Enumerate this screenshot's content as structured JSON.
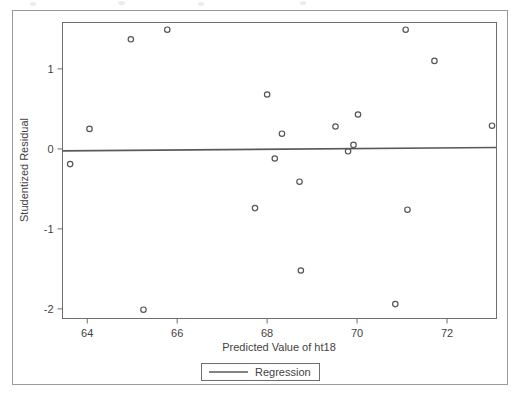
{
  "chart_data": {
    "type": "scatter",
    "title": "",
    "xlabel": "Predicted Value of ht18",
    "ylabel": "Studentized Residual",
    "xlim": [
      63.45,
      73.1
    ],
    "ylim": [
      -2.12,
      1.58
    ],
    "xticks": [
      64,
      66,
      68,
      70,
      72
    ],
    "yticks": [
      1,
      0,
      -1,
      -2
    ],
    "xtick_labels": [
      "64",
      "66",
      "68",
      "70",
      "72"
    ],
    "ytick_labels": [
      "1",
      "0",
      "-1",
      "-2"
    ],
    "grid": false,
    "marker": "open-circle",
    "marker_color": "#555555",
    "legend": {
      "position": "below-axis-centered",
      "entries": [
        {
          "label": "Regression",
          "type": "line",
          "color": "#5a5a5a"
        }
      ]
    },
    "series": [
      {
        "name": "Studentized Residual",
        "type": "scatter",
        "points": [
          {
            "x": 63.62,
            "y": -0.19
          },
          {
            "x": 64.05,
            "y": 0.25
          },
          {
            "x": 64.97,
            "y": 1.37
          },
          {
            "x": 65.25,
            "y": -2.01
          },
          {
            "x": 65.78,
            "y": 1.49
          },
          {
            "x": 67.73,
            "y": -0.74
          },
          {
            "x": 68.0,
            "y": 0.68
          },
          {
            "x": 68.17,
            "y": -0.12
          },
          {
            "x": 68.33,
            "y": 0.19
          },
          {
            "x": 68.72,
            "y": -0.41
          },
          {
            "x": 68.75,
            "y": -1.52
          },
          {
            "x": 69.52,
            "y": 0.28
          },
          {
            "x": 69.8,
            "y": -0.03
          },
          {
            "x": 69.92,
            "y": 0.05
          },
          {
            "x": 70.02,
            "y": 0.43
          },
          {
            "x": 70.85,
            "y": -1.94
          },
          {
            "x": 71.08,
            "y": 1.49
          },
          {
            "x": 71.12,
            "y": -0.76
          },
          {
            "x": 71.72,
            "y": 1.1
          },
          {
            "x": 73.0,
            "y": 0.29
          }
        ]
      },
      {
        "name": "Regression",
        "type": "line",
        "points": [
          {
            "x": 63.45,
            "y": -0.025
          },
          {
            "x": 73.1,
            "y": 0.018
          }
        ]
      }
    ]
  }
}
